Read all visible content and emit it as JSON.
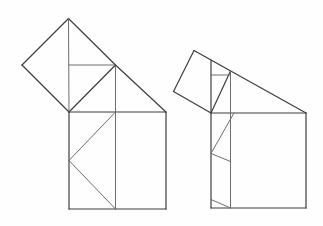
{
  "canvas": {
    "width": 323,
    "height": 226,
    "background": "#fefefe"
  },
  "style": {
    "outline_color": "#3d3d3d",
    "interior_color": "#6e6e6e",
    "outline_width": 1.2,
    "interior_width": 1.0
  },
  "figures": [
    {
      "id": "left-dissection-figure",
      "segments": [
        {
          "name": "diamond-side-top-left",
          "role": "outline",
          "x1": 68.5,
          "y1": 18.5,
          "x2": 22,
          "y2": 65
        },
        {
          "name": "diamond-side-bottom-left",
          "role": "outline",
          "x1": 22,
          "y1": 65,
          "x2": 69,
          "y2": 112
        },
        {
          "name": "diamond-side-bottom-right",
          "role": "outline",
          "x1": 69,
          "y1": 112,
          "x2": 115.5,
          "y2": 65
        },
        {
          "name": "diamond-side-top-right",
          "role": "outline",
          "x1": 115.5,
          "y1": 65,
          "x2": 68.5,
          "y2": 18.5
        },
        {
          "name": "diamond-vertical-diagonal",
          "role": "interior",
          "x1": 68.5,
          "y1": 18.5,
          "x2": 69,
          "y2": 112
        },
        {
          "name": "diamond-center-to-right-vertex",
          "role": "interior",
          "x1": 68.7,
          "y1": 65,
          "x2": 115.5,
          "y2": 65
        },
        {
          "name": "square-top-edge",
          "role": "outline",
          "x1": 69,
          "y1": 112,
          "x2": 166,
          "y2": 112
        },
        {
          "name": "square-right-edge",
          "role": "outline",
          "x1": 166,
          "y1": 112,
          "x2": 166,
          "y2": 209
        },
        {
          "name": "square-bottom-edge",
          "role": "outline",
          "x1": 166,
          "y1": 209,
          "x2": 69,
          "y2": 209
        },
        {
          "name": "square-left-edge",
          "role": "outline",
          "x1": 69,
          "y1": 209,
          "x2": 69,
          "y2": 112
        },
        {
          "name": "inner-vertical-line",
          "role": "interior",
          "x1": 115.5,
          "y1": 65,
          "x2": 115.5,
          "y2": 209
        },
        {
          "name": "diagonal-to-top-right-corner",
          "role": "outline",
          "x1": 115.5,
          "y1": 65,
          "x2": 166,
          "y2": 112
        },
        {
          "name": "chevron-upper-arm",
          "role": "interior",
          "x1": 69,
          "y1": 160.5,
          "x2": 115.5,
          "y2": 112
        },
        {
          "name": "chevron-lower-arm",
          "role": "interior",
          "x1": 69,
          "y1": 160.5,
          "x2": 115.5,
          "y2": 209
        }
      ]
    },
    {
      "id": "right-dissection-figure",
      "segments": [
        {
          "name": "tilted-square-side-top-left",
          "role": "outline",
          "x1": 194,
          "y1": 50.5,
          "x2": 173.5,
          "y2": 91.5
        },
        {
          "name": "tilted-square-side-bottom-left",
          "role": "outline",
          "x1": 173.5,
          "y1": 91.5,
          "x2": 211,
          "y2": 113
        },
        {
          "name": "tilted-square-side-right",
          "role": "outline",
          "x1": 211,
          "y1": 113,
          "x2": 230.5,
          "y2": 71
        },
        {
          "name": "hypotenuse-line",
          "role": "outline",
          "x1": 194,
          "y1": 50.5,
          "x2": 306,
          "y2": 113
        },
        {
          "name": "square-top-edge",
          "role": "outline",
          "x1": 211,
          "y1": 113,
          "x2": 306,
          "y2": 113
        },
        {
          "name": "square-right-edge",
          "role": "outline",
          "x1": 306,
          "y1": 113,
          "x2": 306,
          "y2": 208
        },
        {
          "name": "square-bottom-edge",
          "role": "outline",
          "x1": 306,
          "y1": 208,
          "x2": 211,
          "y2": 208
        },
        {
          "name": "square-left-edge-extended",
          "role": "outline",
          "x1": 211,
          "y1": 60,
          "x2": 211,
          "y2": 208
        },
        {
          "name": "inner-vertical-line",
          "role": "interior",
          "x1": 230.5,
          "y1": 71,
          "x2": 230.5,
          "y2": 208
        },
        {
          "name": "inner-horizontal-line",
          "role": "interior",
          "x1": 211,
          "y1": 75,
          "x2": 230.5,
          "y2": 75
        },
        {
          "name": "upper-inner-diagonal",
          "role": "interior",
          "x1": 234,
          "y1": 113,
          "x2": 211,
          "y2": 153.5
        },
        {
          "name": "middle-inner-diagonal",
          "role": "interior",
          "x1": 211,
          "y1": 153.5,
          "x2": 230.5,
          "y2": 161.5
        },
        {
          "name": "lower-inner-diagonal",
          "role": "interior",
          "x1": 211,
          "y1": 199.5,
          "x2": 230.5,
          "y2": 208
        }
      ]
    }
  ]
}
